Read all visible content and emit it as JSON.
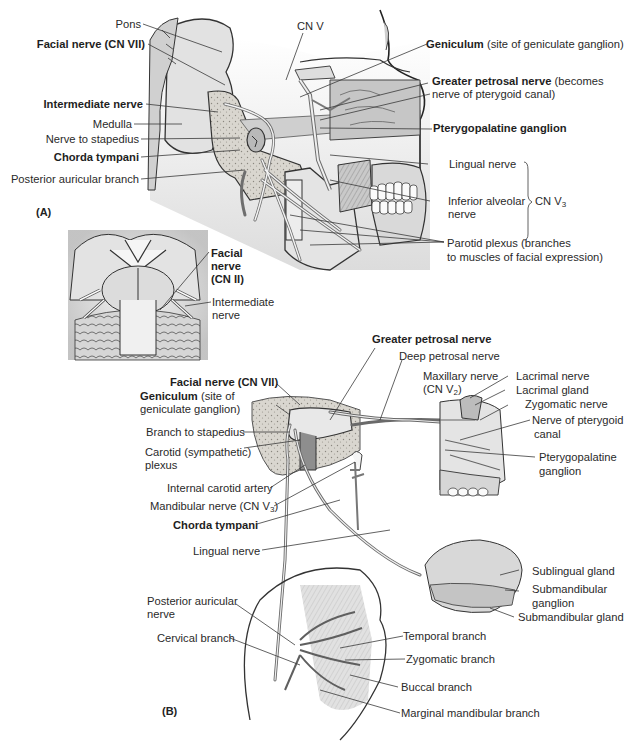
{
  "figure": {
    "panel_a": {
      "marker": "(A)",
      "labels": {
        "pons": "Pons",
        "facial_nerve": "Facial nerve (CN VII)",
        "intermediate_nerve": "Intermediate nerve",
        "medulla": "Medulla",
        "nerve_to_stapedius": "Nerve to stapedius",
        "chorda_tympani": "Chorda tympani",
        "posterior_auricular_branch": "Posterior auricular branch",
        "cn_v": "CN V",
        "geniculum_bold": "Geniculum",
        "geniculum_note": " (site of geniculate ganglion)",
        "greater_petrosal_bold": "Greater petrosal nerve",
        "greater_petrosal_note_1": " (becomes",
        "greater_petrosal_note_2": "nerve of pterygoid canal)",
        "pterygopalatine_ganglion": "Pterygopalatine ganglion",
        "lingual_nerve": "Lingual nerve",
        "inferior_alveolar_1": "Inferior alveolar",
        "inferior_alveolar_2": "nerve",
        "cn_v3_base": "CN V",
        "cn_v3_sub": "3",
        "parotid_plexus_1": "Parotid plexus (branches",
        "parotid_plexus_2": "to muscles of facial expression)"
      }
    },
    "inset": {
      "labels": {
        "facial_nerve_1": "Facial",
        "facial_nerve_2": "nerve",
        "facial_nerve_3": "(CN II)",
        "intermediate_1": "Intermediate",
        "intermediate_2": "nerve"
      }
    },
    "panel_b": {
      "marker": "(B)",
      "labels": {
        "greater_petrosal_nerve": "Greater petrosal nerve",
        "deep_petrosal_nerve": "Deep petrosal nerve",
        "facial_nerve": "Facial nerve (CN VII)",
        "geniculum_bold": "Geniculum",
        "geniculum_note_1": " (site of",
        "geniculum_note_2": "geniculate ganglion)",
        "maxillary_1": "Maxillary nerve",
        "maxillary_2_base": "(CN V",
        "maxillary_2_sub": "2",
        "maxillary_2_end": ")",
        "lacrimal_nerve": "Lacrimal nerve",
        "lacrimal_gland": "Lacrimal gland",
        "zygomatic_nerve": "Zygomatic nerve",
        "pterygoid_canal_1": "Nerve of pterygoid",
        "pterygoid_canal_2": "canal",
        "branch_to_stapedius": "Branch to stapedius",
        "carotid_plexus_1": "Carotid (sympathetic)",
        "carotid_plexus_2": "plexus",
        "pterygopalatine_1": "Pterygopalatine",
        "pterygopalatine_2": "ganglion",
        "internal_carotid": "Internal carotid artery",
        "mandibular_base": "Mandibular nerve (CN V",
        "mandibular_sub": "3",
        "mandibular_end": ")",
        "chorda_tympani": "Chorda tympani",
        "lingual_nerve": "Lingual nerve",
        "sublingual_gland": "Sublingual gland",
        "submandibular_ganglion_1": "Submandibular",
        "submandibular_ganglion_2": "ganglion",
        "submandibular_gland": "Submandibular gland",
        "posterior_auricular_1": "Posterior auricular",
        "posterior_auricular_2": "nerve",
        "cervical_branch": "Cervical branch",
        "temporal_branch": "Temporal branch",
        "zygomatic_branch": "Zygomatic branch",
        "buccal_branch": "Buccal branch",
        "marginal_mandibular_branch": "Marginal mandibular branch"
      }
    },
    "colors": {
      "ink": "#2a2a2a",
      "shade_light": "#e6e6e6",
      "shade_mid": "#c8c8c8",
      "shade_dark": "#8a8a8a",
      "nerve": "#7a7a7a"
    }
  }
}
